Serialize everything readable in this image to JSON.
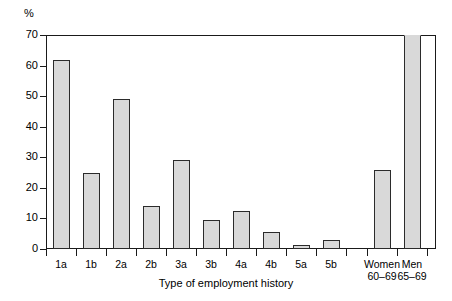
{
  "chart_data": {
    "type": "bar",
    "title": "",
    "subtitle": "",
    "xlabel": "Type of employment history",
    "ylabel": "%",
    "ylim": [
      0,
      70
    ],
    "yticks": [
      0,
      10,
      20,
      30,
      40,
      50,
      60,
      70
    ],
    "ytick_labels": [
      "0",
      "10",
      "20",
      "30",
      "40",
      "50",
      "60",
      "70"
    ],
    "grid": false,
    "legend": null,
    "categories": [
      "1a",
      "1b",
      "2a",
      "2b",
      "3a",
      "3b",
      "4a",
      "4b",
      "5a",
      "5b",
      "Women 60–69",
      "Men 65–69"
    ],
    "category_labels": [
      {
        "line1": "1a",
        "line2": ""
      },
      {
        "line1": "1b",
        "line2": ""
      },
      {
        "line1": "2a",
        "line2": ""
      },
      {
        "line1": "2b",
        "line2": ""
      },
      {
        "line1": "3a",
        "line2": ""
      },
      {
        "line1": "3b",
        "line2": ""
      },
      {
        "line1": "4a",
        "line2": ""
      },
      {
        "line1": "4b",
        "line2": ""
      },
      {
        "line1": "5a",
        "line2": ""
      },
      {
        "line1": "5b",
        "line2": ""
      },
      {
        "line1": "Women",
        "line2": "60–69"
      },
      {
        "line1": "Men",
        "line2": "65–69"
      }
    ],
    "values": [
      62,
      25,
      49,
      14,
      29,
      9.5,
      12.5,
      5.5,
      1.3,
      3,
      26,
      71
    ],
    "value_notes": {
      "Men 65–69": "bar extends to / beyond the top of the plot frame (clipped at 70)"
    },
    "bar_color": "#d9d9d9",
    "bar_edge_color": "#2b2b2b",
    "axis_color": "#1a1a1a",
    "background": "#ffffff"
  }
}
